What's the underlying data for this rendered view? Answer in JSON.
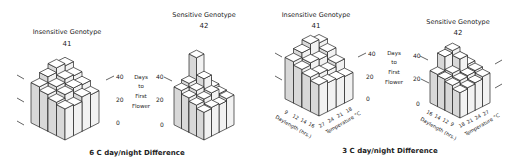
{
  "figure": {
    "panels": [
      {
        "caption": "6 C day/night Difference",
        "ylabel_lines": [
          "Days",
          "to",
          "First",
          "Flower"
        ],
        "charts": [
          {
            "title": "Insensitive Genotype",
            "id_label": "41",
            "yticks": [
              "0",
              "20",
              "40"
            ]
          },
          {
            "title": "Sensitive Genotype",
            "id_label": "42",
            "yticks": [
              "0",
              "20",
              "40"
            ]
          }
        ]
      },
      {
        "caption": "3 C day/night Difference",
        "ylabel_lines": [
          "Days",
          "to",
          "First",
          "Flower"
        ],
        "charts": [
          {
            "title": "Insensitive Genotype",
            "id_label": "41",
            "yticks": [
              "0",
              "20",
              "40"
            ],
            "xlabel": "Daylength (hrs.)",
            "xticks": [
              "9",
              "12",
              "14",
              "16"
            ],
            "zlabel": "Temperature °C",
            "zticks": [
              "27",
              "24",
              "21",
              "18"
            ]
          },
          {
            "title": "Sensitive Genotype",
            "id_label": "42",
            "yticks": [
              "0",
              "20",
              "40"
            ],
            "xlabel": "Daylength (hrs.)",
            "xticks": [
              "16",
              "14",
              "12",
              "9"
            ],
            "zlabel": "Temperature °C",
            "zticks": [
              "18",
              "21",
              "24",
              "27"
            ]
          }
        ]
      }
    ]
  },
  "chart_data": [
    {
      "type": "bar3d",
      "title": "Insensitive Genotype 41 — 6 C day/night Difference",
      "ylabel": "Days to First Flower",
      "ylim": [
        0,
        45
      ],
      "grid": [
        [
          27,
          26,
          30,
          28
        ],
        [
          29,
          32,
          34,
          33
        ],
        [
          32,
          35,
          38,
          37
        ],
        [
          35,
          40,
          44,
          42
        ]
      ]
    },
    {
      "type": "bar3d",
      "title": "Sensitive Genotype 42 — 6 C day/night Difference",
      "ylabel": "Days to First Flower",
      "ylim": [
        0,
        60
      ],
      "grid": [
        [
          24,
          25,
          24,
          26
        ],
        [
          27,
          29,
          31,
          27
        ],
        [
          30,
          33,
          40,
          29
        ],
        [
          33,
          36,
          55,
          31
        ]
      ]
    },
    {
      "type": "bar3d",
      "title": "Insensitive Genotype 41 — 3 C day/night Difference",
      "ylabel": "Days to First Flower",
      "xlabel": "Daylength (hrs.)",
      "x": [
        9,
        12,
        14,
        16
      ],
      "zlabel": "Temperature °C",
      "z": [
        27,
        24,
        21,
        18
      ],
      "ylim": [
        0,
        45
      ],
      "grid": [
        [
          27,
          25,
          24,
          23
        ],
        [
          30,
          29,
          28,
          31
        ],
        [
          33,
          35,
          34,
          37
        ],
        [
          36,
          40,
          44,
          41
        ]
      ]
    },
    {
      "type": "bar3d",
      "title": "Sensitive Genotype 42 — 3 C day/night Difference",
      "ylabel": "Days to First Flower",
      "xlabel": "Daylength (hrs.)",
      "x": [
        16,
        14,
        12,
        9
      ],
      "zlabel": "Temperature °C",
      "z": [
        18,
        21,
        24,
        27
      ],
      "ylim": [
        0,
        45
      ],
      "grid": [
        [
          22,
          23,
          24,
          26
        ],
        [
          25,
          26,
          27,
          28
        ],
        [
          27,
          29,
          38,
          30
        ],
        [
          28,
          40,
          42,
          31
        ]
      ]
    }
  ]
}
